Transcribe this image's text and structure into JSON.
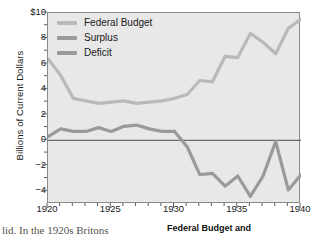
{
  "chart_data": {
    "type": "line",
    "title": "",
    "xlabel": "",
    "ylabel": "Billions of Current Dollars",
    "xlim": [
      1920,
      1940
    ],
    "ylim": [
      -5,
      10
    ],
    "xticks": [
      1920,
      1925,
      1930,
      1935,
      1940
    ],
    "xticklabels": [
      "1920",
      "1925",
      "1930",
      "1935",
      "1940"
    ],
    "yticks": [
      -4,
      -2,
      0,
      2,
      4,
      6,
      8,
      10
    ],
    "yticklabels": [
      "−4",
      "−2",
      "0",
      "2",
      "4",
      "6",
      "8",
      "$10"
    ],
    "grid": false,
    "legend_position": "upper-left",
    "zero_line": true,
    "x": [
      1920,
      1921,
      1922,
      1923,
      1924,
      1925,
      1926,
      1927,
      1928,
      1929,
      1930,
      1931,
      1932,
      1933,
      1934,
      1935,
      1936,
      1937,
      1938,
      1939,
      1940
    ],
    "series": [
      {
        "name": "Federal Budget",
        "color": "#b9b9b9",
        "values": [
          6.4,
          5.1,
          3.3,
          3.1,
          2.9,
          3.0,
          3.1,
          2.9,
          3.0,
          3.1,
          3.3,
          3.6,
          4.7,
          4.6,
          6.6,
          6.5,
          8.4,
          7.7,
          6.8,
          8.8,
          9.5
        ]
      },
      {
        "name": "Surplus",
        "color": "#9a9a9a",
        "values": [
          0.3,
          0.9,
          0.7,
          0.7,
          1.0,
          0.7,
          1.1,
          1.2,
          0.9,
          0.7,
          0.7,
          null,
          null,
          null,
          null,
          null,
          null,
          null,
          null,
          null,
          null
        ]
      },
      {
        "name": "Deficit",
        "color": "#9a9a9a",
        "values": [
          null,
          null,
          null,
          null,
          null,
          null,
          null,
          null,
          null,
          null,
          0.7,
          -0.5,
          -2.7,
          -2.6,
          -3.6,
          -2.8,
          -4.4,
          -2.8,
          -0.1,
          -3.9,
          -2.7
        ]
      }
    ],
    "legend": [
      {
        "label": "Federal Budget",
        "color": "#b9b9b9"
      },
      {
        "label": "Surplus",
        "color": "#9a9a9a"
      },
      {
        "label": "Deficit",
        "color": "#9a9a9a"
      }
    ]
  },
  "caption": {
    "bold_text": "Federal Budget and",
    "body_text": "lid. In the 1920s Britons"
  }
}
